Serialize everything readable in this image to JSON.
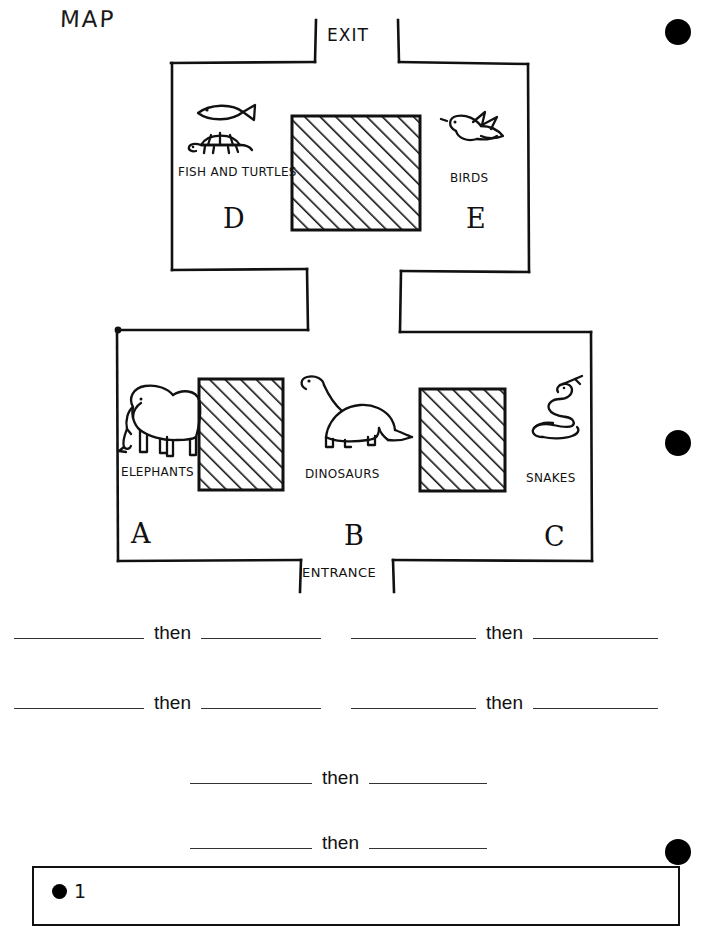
{
  "page": {
    "title": "MAP",
    "margin_dots": [
      {
        "name": "margin-dot-top",
        "x": 678,
        "y": 32,
        "d": 26
      },
      {
        "name": "margin-dot-middle",
        "x": 678,
        "y": 443,
        "d": 26
      },
      {
        "name": "margin-dot-bottom",
        "x": 678,
        "y": 852,
        "d": 26
      }
    ]
  },
  "map": {
    "doors": {
      "exit": "EXIT",
      "entrance": "ENTRANCE"
    },
    "upper_rooms": [
      {
        "letter": "D",
        "label": "FISH AND TURTLES",
        "icons": [
          "fish-icon",
          "turtle-icon"
        ]
      },
      {
        "letter": "E",
        "label": "BIRDS",
        "icons": [
          "bird-icon"
        ]
      }
    ],
    "lower_rooms": [
      {
        "letter": "A",
        "label": "ELEPHANTS",
        "icons": [
          "elephant-icon"
        ]
      },
      {
        "letter": "B",
        "label": "DINOSAURS",
        "icons": [
          "dinosaur-icon"
        ]
      },
      {
        "letter": "C",
        "label": "SNAKES",
        "icons": [
          "snake-icon"
        ]
      }
    ],
    "blocks": [
      {
        "name": "upper-center-block",
        "fill": "diagonal-hatch"
      },
      {
        "name": "lower-left-block",
        "fill": "diagonal-hatch"
      },
      {
        "name": "lower-right-block",
        "fill": "diagonal-hatch"
      }
    ],
    "colors": {
      "ink": "#111111",
      "paper": "#ffffff"
    }
  },
  "answers": {
    "then_label": "then",
    "rows": [
      {
        "name": "answer-row-1",
        "items": [
          {
            "blank_before": "",
            "then": "then",
            "blank_after": ""
          },
          {
            "blank_before": "",
            "then": "then",
            "blank_after": ""
          }
        ]
      },
      {
        "name": "answer-row-2",
        "items": [
          {
            "blank_before": "",
            "then": "then",
            "blank_after": ""
          },
          {
            "blank_before": "",
            "then": "then",
            "blank_after": ""
          }
        ]
      },
      {
        "name": "answer-row-3",
        "items": [
          {
            "blank_before": "",
            "then": "then",
            "blank_after": ""
          }
        ]
      },
      {
        "name": "answer-row-4",
        "items": [
          {
            "blank_before": "",
            "then": "then",
            "blank_after": ""
          }
        ]
      }
    ]
  },
  "footer": {
    "number": "1"
  }
}
